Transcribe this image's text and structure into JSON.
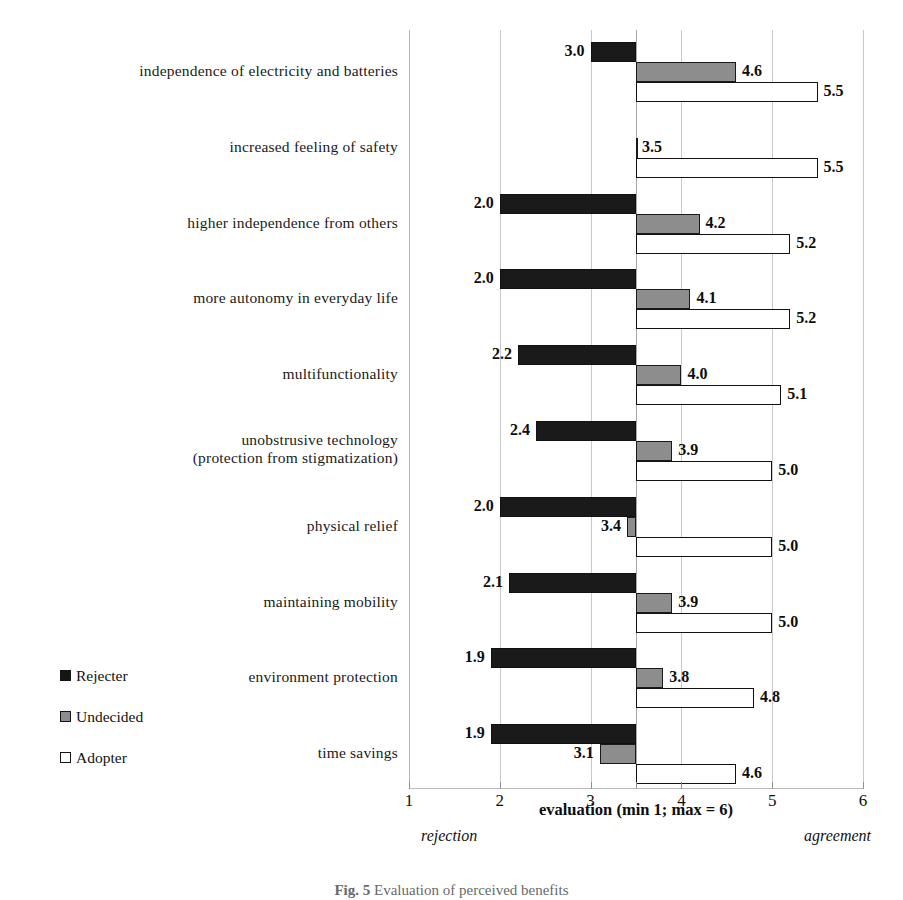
{
  "chart_data": {
    "type": "bar",
    "orientation": "horizontal",
    "title": "",
    "xlabel": "evaluation (min  1; max = 6)",
    "ylabel": "",
    "xlim": [
      1,
      6
    ],
    "baseline": 3.5,
    "grid": true,
    "xticks": [
      1,
      2,
      3,
      4,
      5,
      6
    ],
    "xtick_labels": [
      "1",
      "2",
      "3",
      "4",
      "5",
      "6"
    ],
    "pole_labels": {
      "low": "rejection",
      "high": "agreement"
    },
    "legend_position": "lower-left",
    "categories": [
      "independence of electricity and batteries",
      "increased feeling of safety",
      "higher independence from others",
      "more autonomy in everyday life",
      "multifunctionality",
      "unobstrusive technology\n(protection from stigmatization)",
      "physical relief",
      "maintaining mobility",
      "environment protection",
      "time savings"
    ],
    "series": [
      {
        "name": "Rejecter",
        "color": "#1a1a1a",
        "values": [
          3.0,
          null,
          2.0,
          2.0,
          2.2,
          2.4,
          2.0,
          2.1,
          1.9,
          1.9
        ],
        "labels": [
          "3.0",
          "",
          "2.0",
          "2.0",
          "2.2",
          "2.4",
          "2.0",
          "2.1",
          "1.9",
          "1.9"
        ]
      },
      {
        "name": "Undecided",
        "color": "#8d8d8d",
        "values": [
          4.6,
          3.5,
          4.2,
          4.1,
          4.0,
          3.9,
          3.4,
          3.9,
          3.8,
          3.1
        ],
        "labels": [
          "4.6",
          "3.5",
          "4.2",
          "4.1",
          "4.0",
          "3.9",
          "3.4",
          "3.9",
          "3.8",
          "3.1"
        ]
      },
      {
        "name": "Adopter",
        "color": "#ffffff",
        "values": [
          5.5,
          5.5,
          5.2,
          5.2,
          5.1,
          5.0,
          5.0,
          5.0,
          4.8,
          4.6
        ],
        "labels": [
          "5.5",
          "5.5",
          "5.2",
          "5.2",
          "5.1",
          "5.0",
          "5.0",
          "5.0",
          "4.8",
          "4.6"
        ]
      }
    ]
  },
  "legend": {
    "items": [
      {
        "label": "Rejecter",
        "swatch": "black-square-icon"
      },
      {
        "label": "Undecided",
        "swatch": "gray-square-icon"
      },
      {
        "label": "Adopter",
        "swatch": "white-square-icon"
      }
    ]
  },
  "axis": {
    "title": "evaluation (min  1; max = 6)",
    "ticks": [
      "1",
      "2",
      "3",
      "4",
      "5",
      "6"
    ],
    "low_pole": "rejection",
    "high_pole": "agreement"
  },
  "caption": {
    "figure_number": "Fig. 5",
    "text": "Evaluation of perceived benefits"
  }
}
